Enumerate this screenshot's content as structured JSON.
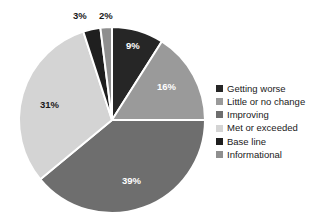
{
  "chart_data": {
    "type": "pie",
    "title": "",
    "subtitle": "",
    "xlabel": "",
    "ylabel": "",
    "grid": false,
    "legend_position": "right",
    "start_angle_deg": 0,
    "direction": "clockwise",
    "categories": [
      "Getting worse",
      "Little or no change",
      "Improving",
      "Met or exceeded",
      "Base line",
      "Informational"
    ],
    "values": [
      9,
      16,
      39,
      31,
      3,
      2
    ],
    "value_unit": "%",
    "data_labels": [
      "9%",
      "16%",
      "39%",
      "31%",
      "3%",
      "2%"
    ],
    "colors": [
      "#262626",
      "#9a9a9a",
      "#6e6e6e",
      "#d4d4d4",
      "#1f1f1f",
      "#8f8f8f"
    ],
    "slice_separator_color": "#ffffff"
  },
  "pie": {
    "center_x": 112,
    "center_y": 120,
    "radius": 93,
    "slices": [
      {
        "name": "getting-worse",
        "label": "9%",
        "value": 9,
        "color": "#262626",
        "label_color": "light",
        "label_x": 126,
        "label_y": 41
      },
      {
        "name": "little-or-no-change",
        "label": "16%",
        "value": 16,
        "color": "#9a9a9a",
        "label_color": "light",
        "label_x": 157,
        "label_y": 82
      },
      {
        "name": "improving",
        "label": "39%",
        "value": 39,
        "color": "#6e6e6e",
        "label_color": "light",
        "label_x": 122,
        "label_y": 176
      },
      {
        "name": "met-or-exceeded",
        "label": "31%",
        "value": 31,
        "color": "#d4d4d4",
        "label_color": "dark",
        "label_x": 40,
        "label_y": 100
      },
      {
        "name": "base-line",
        "label": "3%",
        "value": 3,
        "color": "#1f1f1f",
        "label_color": "dark",
        "label_x": 73,
        "label_y": 11
      },
      {
        "name": "informational",
        "label": "2%",
        "value": 2,
        "color": "#8f8f8f",
        "label_color": "dark",
        "label_x": 99,
        "label_y": 11
      }
    ]
  },
  "legend": {
    "items": [
      {
        "label": "Getting worse",
        "color": "#262626"
      },
      {
        "label": "Little or no change",
        "color": "#9a9a9a"
      },
      {
        "label": "Improving",
        "color": "#6e6e6e"
      },
      {
        "label": "Met or exceeded",
        "color": "#d4d4d4"
      },
      {
        "label": "Base line",
        "color": "#1f1f1f"
      },
      {
        "label": "Informational",
        "color": "#8f8f8f"
      }
    ]
  }
}
